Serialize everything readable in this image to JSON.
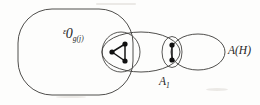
{
  "figure": {
    "background_color": "#fdfdfc",
    "stroke_color": "#3b3a38",
    "dot_color": "#111111"
  },
  "labels": {
    "universe": {
      "base": "ᵋ0",
      "subscript": "g(j)",
      "full_text": "U_g(j)"
    },
    "a_one": {
      "base": "A",
      "subscript": "1",
      "full_text": "A₁"
    },
    "a_of_h": {
      "full_text": "A(H)"
    }
  },
  "regions": [
    {
      "name": "universe-region",
      "shape": "rounded-rect",
      "label": "U_g(j)",
      "x": 18,
      "y": 9,
      "width": 115,
      "height": 86,
      "corner_radius": 34
    },
    {
      "name": "a1-region",
      "shape": "ellipse",
      "label": "A₁",
      "cx": 141,
      "cy": 52,
      "rx": 39,
      "ry": 20
    },
    {
      "name": "small-left-region",
      "shape": "ellipse",
      "label": "",
      "cx": 121,
      "cy": 52,
      "rx": 19,
      "ry": 20
    },
    {
      "name": "small-right-region",
      "shape": "ellipse",
      "label": "",
      "cx": 172,
      "cy": 52,
      "rx": 10,
      "ry": 15.5
    },
    {
      "name": "ah-region",
      "shape": "ellipse",
      "label": "A(H)",
      "cx": 198,
      "cy": 52,
      "rx": 27,
      "ry": 18
    }
  ],
  "graphs": [
    {
      "name": "triangle-graph",
      "vertex_count": 3,
      "edge_count": 3,
      "vertices": [
        {
          "name": "vertex-left",
          "x": 112,
          "y": 52
        },
        {
          "name": "vertex-top-right",
          "x": 125,
          "y": 44
        },
        {
          "name": "vertex-bottom-right",
          "x": 125,
          "y": 61
        }
      ],
      "edges": [
        {
          "from": 0,
          "to": 1
        },
        {
          "from": 0,
          "to": 2
        },
        {
          "from": 1,
          "to": 2
        }
      ]
    },
    {
      "name": "pair-graph",
      "vertex_count": 2,
      "edge_count": 1,
      "vertices": [
        {
          "name": "vertex-upper",
          "x": 172,
          "y": 45
        },
        {
          "name": "vertex-lower",
          "x": 172,
          "y": 60
        }
      ],
      "edges": [
        {
          "from": 0,
          "to": 1
        }
      ]
    }
  ],
  "label_positions": {
    "universe": {
      "x": 38,
      "y": 38
    },
    "a_one": {
      "x": 139,
      "y": 85
    },
    "a_of_h": {
      "x": 228,
      "y": 54
    }
  }
}
